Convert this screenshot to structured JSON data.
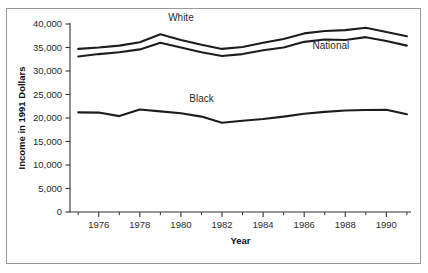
{
  "figure": {
    "background_color": "#ffffff",
    "border_color": "#9a9a9a",
    "line_color": "#1d1d1d",
    "text_color": "#2b2b2b"
  },
  "chart_data": {
    "type": "line",
    "title": "",
    "xlabel": "Year",
    "ylabel": "Income in 1991 Dollars",
    "xlim": [
      1974.6,
      1991.2
    ],
    "ylim": [
      0,
      40000
    ],
    "grid": false,
    "legend_position": "inline-labels",
    "x": [
      1975,
      1976,
      1977,
      1978,
      1979,
      1980,
      1981,
      1982,
      1983,
      1984,
      1985,
      1986,
      1987,
      1988,
      1989,
      1990,
      1991
    ],
    "x_major_ticks": [
      1976,
      1978,
      1980,
      1982,
      1984,
      1986,
      1988,
      1990
    ],
    "x_major_tick_labels": [
      "1976",
      "1978",
      "1980",
      "1982",
      "1984",
      "1986",
      "1988",
      "1990"
    ],
    "x_minor_ticks": [
      1975,
      1977,
      1979,
      1981,
      1983,
      1985,
      1987,
      1989,
      1991
    ],
    "y_ticks": [
      0,
      5000,
      10000,
      15000,
      20000,
      25000,
      30000,
      35000,
      40000
    ],
    "y_tick_labels": [
      "0",
      "5,000",
      "10,000",
      "15,000",
      "20,000",
      "25,000",
      "30,000",
      "35,000",
      "40,000"
    ],
    "series": [
      {
        "name": "White",
        "label": "White",
        "label_x": 1980.0,
        "label_y": 40600,
        "values": [
          34700,
          35000,
          35400,
          36100,
          37800,
          36600,
          35600,
          34700,
          35100,
          36000,
          36800,
          38000,
          38500,
          38700,
          39200,
          38300,
          37400
        ]
      },
      {
        "name": "National",
        "label": "National",
        "label_x": 1987.3,
        "label_y": 34600,
        "values": [
          33100,
          33600,
          34000,
          34600,
          36000,
          35000,
          34000,
          33200,
          33600,
          34400,
          35000,
          36200,
          36700,
          36600,
          37200,
          36400,
          35400
        ]
      },
      {
        "name": "Black",
        "label": "Black",
        "label_x": 1981.0,
        "label_y": 23500,
        "values": [
          21200,
          21150,
          20400,
          21800,
          21400,
          21000,
          20300,
          19000,
          19400,
          19800,
          20300,
          20900,
          21300,
          21600,
          21700,
          21750,
          20800
        ]
      }
    ]
  }
}
